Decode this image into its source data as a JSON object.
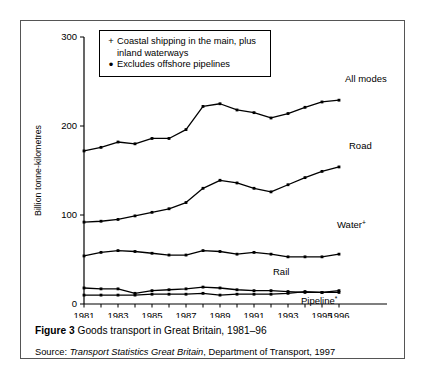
{
  "figure": {
    "caption_bold": "Figure 3",
    "caption_text": "Goods transport in Great Britain, 1981–96",
    "source_prefix": "Source:",
    "source_italic": "Transport Statistics Great Britain",
    "source_rest": ", Department of Transport, 1997"
  },
  "legend": {
    "rows": [
      {
        "symbol": "+",
        "text": "Coastal shipping in the main, plus inland waterways"
      },
      {
        "symbol": "•",
        "text": "Excludes offshore pipelines"
      }
    ]
  },
  "chart_data": {
    "type": "line",
    "title": "Goods transport in Great Britain, 1981–96",
    "xlabel": "Year",
    "ylabel": "Billion tonne-kilometres",
    "xlim": [
      1981,
      1996
    ],
    "ylim": [
      0,
      300
    ],
    "yticks": [
      0,
      100,
      200,
      300
    ],
    "ytick_labels": [
      "0",
      "100",
      "200",
      "300"
    ],
    "xticks": [
      1981,
      1983,
      1985,
      1987,
      1989,
      1991,
      1993,
      1995,
      1996
    ],
    "xtick_labels": [
      "1981",
      "1983",
      "1985",
      "1987",
      "1989",
      "1991",
      "1993",
      "1995",
      "1996"
    ],
    "x": [
      1981,
      1982,
      1983,
      1984,
      1985,
      1986,
      1987,
      1988,
      1989,
      1990,
      1991,
      1992,
      1993,
      1994,
      1995,
      1996
    ],
    "grid": false,
    "legend_position": "right-of-lines",
    "series": [
      {
        "name": "All modes",
        "label": "All modes",
        "label_sup": "",
        "values": [
          172,
          176,
          182,
          180,
          186,
          186,
          196,
          222,
          225,
          218,
          215,
          209,
          214,
          221,
          227,
          229
        ]
      },
      {
        "name": "Road",
        "label": "Road",
        "label_sup": "",
        "values": [
          92,
          93,
          95,
          99,
          103,
          107,
          114,
          130,
          139,
          136,
          130,
          126,
          134,
          142,
          149,
          154
        ]
      },
      {
        "name": "Water",
        "label": "Water",
        "label_sup": "+",
        "values": [
          54,
          58,
          60,
          59,
          57,
          55,
          55,
          60,
          59,
          56,
          58,
          56,
          53,
          53,
          53,
          56
        ]
      },
      {
        "name": "Rail",
        "label": "Rail",
        "label_sup": "",
        "values": [
          18,
          17,
          17,
          12,
          15,
          16,
          17,
          19,
          18,
          16,
          15,
          15,
          14,
          13,
          13,
          15
        ]
      },
      {
        "name": "Pipeline",
        "label": "Pipeline",
        "label_sup": "*",
        "values": [
          10,
          10,
          10,
          10,
          11,
          11,
          11,
          12,
          10,
          11,
          11,
          11,
          12,
          14,
          13,
          13
        ]
      }
    ]
  }
}
